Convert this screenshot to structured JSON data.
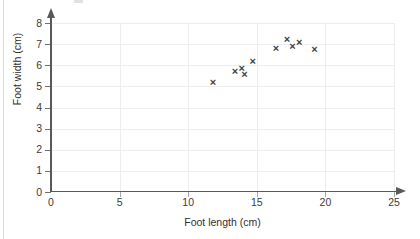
{
  "chart_data": {
    "type": "scatter",
    "title": "",
    "xlabel": "Foot length (cm)",
    "ylabel": "Foot width (cm)",
    "xlim": [
      0,
      25
    ],
    "ylim": [
      0,
      8
    ],
    "xticks": [
      0,
      5,
      10,
      15,
      20,
      25
    ],
    "yticks": [
      0,
      1,
      2,
      3,
      4,
      5,
      6,
      7,
      8
    ],
    "xtick_labels": [
      "0",
      "5",
      "10",
      "15",
      "20",
      "25"
    ],
    "ytick_labels": [
      "0",
      "1",
      "2",
      "3",
      "4",
      "5",
      "6",
      "7",
      "8"
    ],
    "grid": true,
    "grid_axis": "both",
    "legend": null,
    "marker": "x",
    "marker_color": "#3f3f42",
    "axis_color": "#58595b",
    "grid_color": "#ededf0",
    "background": "#ffffff",
    "points": [
      {
        "x": 11.8,
        "y": 5.2
      },
      {
        "x": 13.4,
        "y": 5.7
      },
      {
        "x": 13.9,
        "y": 5.85
      },
      {
        "x": 14.1,
        "y": 5.55
      },
      {
        "x": 14.7,
        "y": 6.2
      },
      {
        "x": 16.4,
        "y": 6.8
      },
      {
        "x": 17.2,
        "y": 7.2
      },
      {
        "x": 17.6,
        "y": 6.9
      },
      {
        "x": 18.1,
        "y": 7.1
      },
      {
        "x": 19.2,
        "y": 6.75
      }
    ]
  }
}
